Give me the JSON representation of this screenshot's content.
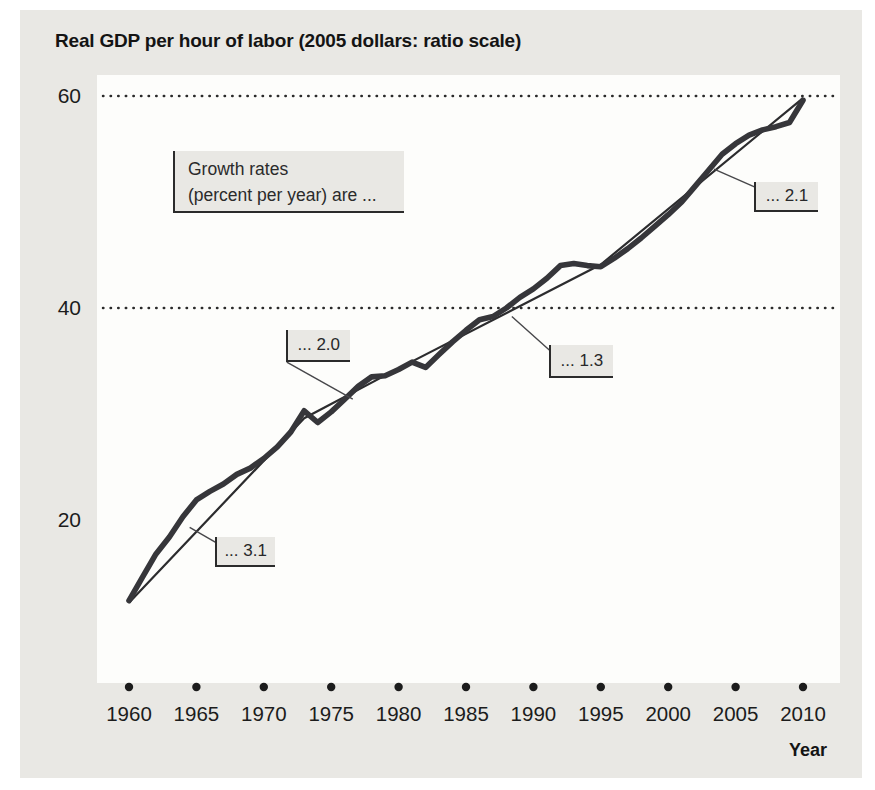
{
  "figure": {
    "title": "Real GDP per hour of labor (2005 dollars: ratio scale)",
    "x_axis_label": "Year",
    "callout": {
      "line1": "Growth rates",
      "line2": "(percent per year) are ..."
    }
  },
  "chart_data": {
    "type": "line",
    "title": "Real GDP per hour of labor (2005 dollars: ratio scale)",
    "xlabel": "Year",
    "ylabel": "Real GDP per hour of labor (2005 dollars)",
    "scale_note": "ratio scale",
    "x_range": [
      1960,
      2010
    ],
    "x_ticks": [
      1960,
      1965,
      1970,
      1975,
      1980,
      1985,
      1990,
      1995,
      2000,
      2005,
      2010
    ],
    "y_ticks": [
      60,
      40,
      20
    ],
    "gridline_values": [
      60,
      40
    ],
    "series": [
      {
        "name": "Real GDP per hour of labor",
        "role": "data",
        "x_start": 1960,
        "x_step": 1,
        "values": [
          12.4,
          14.6,
          16.8,
          18.4,
          20.3,
          21.9,
          22.7,
          23.4,
          24.3,
          24.9,
          25.8,
          26.9,
          28.3,
          30.3,
          29.2,
          30.2,
          31.4,
          32.6,
          33.5,
          33.6,
          34.2,
          34.9,
          34.4,
          35.6,
          36.8,
          37.9,
          38.9,
          39.2,
          40.0,
          41.0,
          41.8,
          42.8,
          44.0,
          44.2,
          44.0,
          43.9,
          44.7,
          45.6,
          46.6,
          47.7,
          48.8,
          50.0,
          51.5,
          53.0,
          54.5,
          55.5,
          56.3,
          56.8,
          57.1,
          57.5,
          59.6
        ]
      },
      {
        "name": "Constant-growth trend segments",
        "role": "trend",
        "x": [
          1960,
          1973,
          1980,
          1995,
          2010
        ],
        "values": [
          12.2,
          29.6,
          34.3,
          44.1,
          59.8
        ]
      }
    ],
    "annotations": [
      {
        "label": "... 3.1",
        "rate_percent_per_year": 3.1,
        "attach_year": 1964.5,
        "attach_value": 19.3,
        "box": {
          "dx": 25,
          "dy": 10,
          "w": 60,
          "h": 30
        },
        "leader_anchor": "top"
      },
      {
        "label": "... 2.0",
        "rate_percent_per_year": 2.0,
        "attach_year": 1976.6,
        "attach_value": 31.4,
        "box": {
          "dx": -67,
          "dy": -69,
          "w": 64,
          "h": 32
        },
        "leader_anchor": "bottom"
      },
      {
        "label": "... 1.3",
        "rate_percent_per_year": 1.3,
        "attach_year": 1988.4,
        "attach_value": 39.2,
        "box": {
          "dx": 37,
          "dy": 29,
          "w": 64,
          "h": 33
        },
        "leader_anchor": "top"
      },
      {
        "label": "... 2.1",
        "rate_percent_per_year": 2.1,
        "attach_year": 2003.4,
        "attach_value": 53.1,
        "box": {
          "dx": 40,
          "dy": 13,
          "w": 64,
          "h": 30
        },
        "leader_anchor": "top"
      }
    ]
  }
}
